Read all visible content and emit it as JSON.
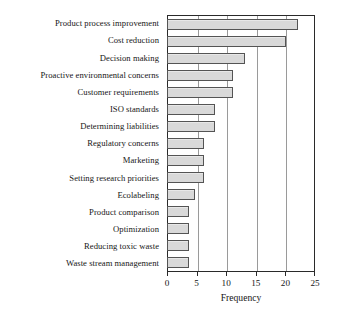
{
  "chart_data": {
    "type": "bar",
    "orientation": "horizontal",
    "title": "",
    "xlabel": "Frequency",
    "ylabel": "",
    "xlim": [
      0,
      25
    ],
    "xticks": [
      0,
      5,
      10,
      15,
      20,
      25
    ],
    "grid": "vertical",
    "legend": "none",
    "bar_fill_color": "#d9d9d9",
    "bar_edge_color": "#545454",
    "axis_color": "#2a2a2a",
    "gridline_color": "#9a9a9a",
    "categories": [
      "Product process improvement",
      "Cost reduction",
      "Decision making",
      "Proactive environmental concerns",
      "Customer requirements",
      "ISO standards",
      "Determining liabilities",
      "Regulatory concerns",
      "Marketing",
      "Setting research priorities",
      "Ecolabeling",
      "Product comparison",
      "Optimization",
      "Reducing toxic waste",
      "Waste stream management"
    ],
    "values": [
      22,
      20,
      13,
      11,
      11,
      8,
      8,
      6,
      6,
      6,
      4.5,
      3.5,
      3.5,
      3.5,
      3.5
    ]
  }
}
